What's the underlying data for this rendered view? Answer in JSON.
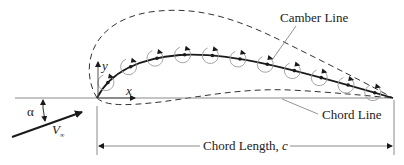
{
  "diagram": {
    "type": "thin airfoil theory – vortex sheet along camber line",
    "labels": {
      "camber_line": "Camber Line",
      "chord_line": "Chord Line",
      "chord_length_prefix": "Chord Length, ",
      "chord_length_symbol": "c",
      "x_axis": "x",
      "y_axis": "y",
      "angle_of_attack": "α",
      "freestream_symbol": "V",
      "freestream_subscript": "∞"
    },
    "elements": {
      "vortex_count": 11,
      "camber_line_style": "solid with dots",
      "airfoil_outline_style": "dashed",
      "chord_line_style": "solid grey"
    },
    "colors": {
      "ink": "#1a1a1a",
      "grey": "#8a8a8a",
      "vortex": "#9a9a9a"
    }
  }
}
